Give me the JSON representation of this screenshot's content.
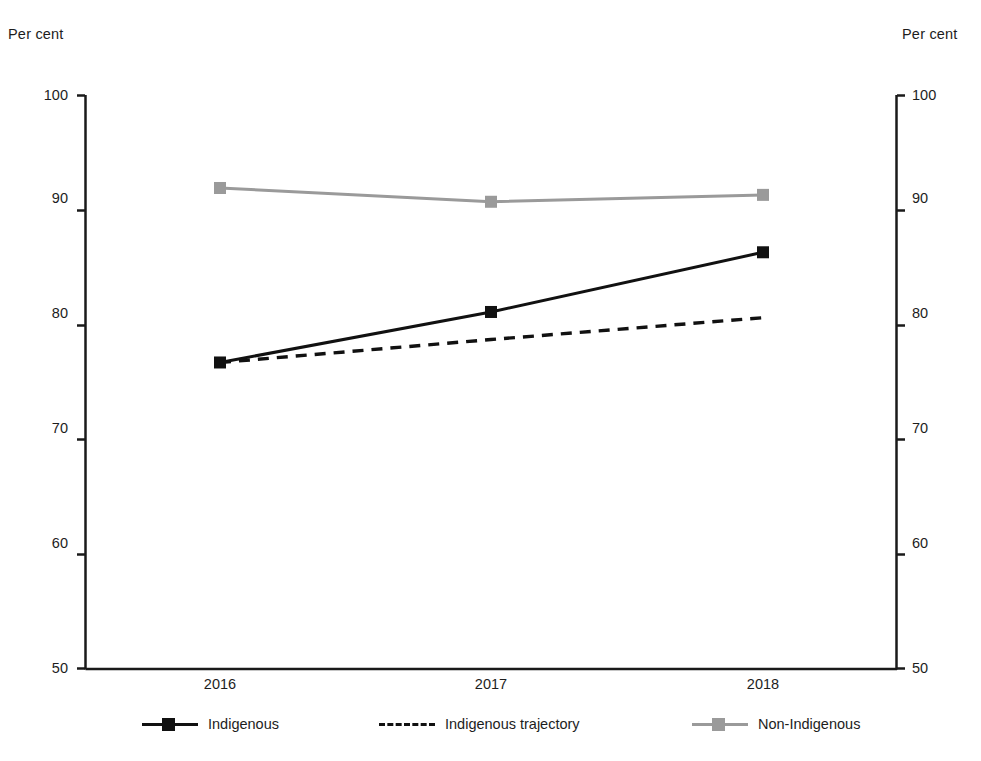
{
  "chart_data": {
    "type": "line",
    "title": "",
    "xlabel": "",
    "ylabel": "Per cent",
    "ylabel_right": "Per cent",
    "categories": [
      "2016",
      "2017",
      "2018"
    ],
    "x": [
      2016,
      2017,
      2018
    ],
    "ylim": [
      50,
      100
    ],
    "yticks": [
      50,
      60,
      70,
      80,
      90,
      100
    ],
    "ytick_labels": [
      "50",
      "60",
      "70",
      "80",
      "90",
      "100"
    ],
    "yticks_right": [
      50,
      60,
      70,
      80,
      90,
      100
    ],
    "ytick_labels_right": [
      "50",
      "60",
      "70",
      "80",
      "90",
      "100"
    ],
    "grid": false,
    "legend_position": "bottom",
    "series": [
      {
        "name": "Indigenous",
        "values": [
          76.7,
          81.1,
          86.3
        ],
        "color": "#111111",
        "style": "solid",
        "marker": "square"
      },
      {
        "name": "Indigenous trajectory",
        "values": [
          76.7,
          78.7,
          80.6
        ],
        "color": "#111111",
        "style": "dashed",
        "marker": "none"
      },
      {
        "name": "Non-Indigenous",
        "values": [
          91.9,
          90.7,
          91.3
        ],
        "color": "#9a9a9a",
        "style": "solid",
        "marker": "square"
      }
    ]
  },
  "axes": {
    "unit_label_left": "Per cent",
    "unit_label_right": "Per cent",
    "y_tick_labels": [
      "100",
      "90",
      "80",
      "70",
      "60",
      "50"
    ],
    "y_tick_labels_right": [
      "100",
      "90",
      "80",
      "70",
      "60",
      "50"
    ],
    "x_tick_labels": [
      "2016",
      "2017",
      "2018"
    ]
  },
  "legend": {
    "items": [
      {
        "label": "Indigenous",
        "swatch": "solid-dark-marker"
      },
      {
        "label": "Indigenous trajectory",
        "swatch": "dashed-dark"
      },
      {
        "label": "Non-Indigenous",
        "swatch": "solid-gray-marker"
      }
    ]
  }
}
